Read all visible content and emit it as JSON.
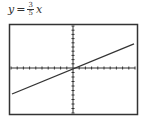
{
  "equation": {
    "lhs": "y",
    "equals": "=",
    "numerator": "3",
    "denominator": "5",
    "variable": "x"
  },
  "chart_data": {
    "type": "line",
    "xlabel": "",
    "ylabel": "",
    "xlim": [
      -10,
      10
    ],
    "ylim": [
      -10,
      10
    ],
    "grid": false,
    "xticks_count": 20,
    "yticks_count": 20,
    "series": [
      {
        "name": "y = 3/5 x",
        "slope": 0.6,
        "intercept": 0,
        "x": [
          -10,
          10
        ],
        "y": [
          -6,
          6
        ]
      }
    ]
  },
  "colors": {
    "frame": "#333333",
    "line": "#333333",
    "background": "#ffffff"
  }
}
